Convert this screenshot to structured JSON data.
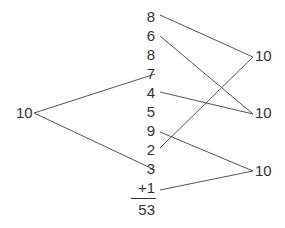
{
  "diagram": {
    "left_total": "10",
    "addends": [
      "8",
      "6",
      "8",
      "7",
      "4",
      "5",
      "9",
      "2",
      "3",
      "+1"
    ],
    "sum": "53",
    "right_tens": [
      "10",
      "10",
      "10"
    ],
    "connections": [
      {
        "from": "left_total",
        "to_addend_index": 3
      },
      {
        "from": "left_total",
        "to_addend_index": 8
      },
      {
        "addend_index": 0,
        "to_ten": 0
      },
      {
        "addend_index": 7,
        "to_ten": 0
      },
      {
        "addend_index": 1,
        "to_ten": 1
      },
      {
        "addend_index": 4,
        "to_ten": 1
      },
      {
        "addend_index": 6,
        "to_ten": 2
      },
      {
        "addend_index": 9,
        "to_ten": 2
      }
    ],
    "line_color": "#555555",
    "text_color": "#333333"
  }
}
